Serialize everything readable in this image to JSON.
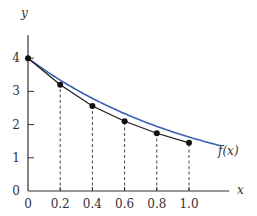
{
  "chart_data": {
    "type": "line",
    "title": "",
    "xlabel": "x",
    "ylabel": "y",
    "xlim": [
      0,
      1.2
    ],
    "ylim": [
      0,
      4.6
    ],
    "x_ticks": [
      "0",
      "0.2",
      "0.4",
      "0.6",
      "0.8",
      "1.0"
    ],
    "y_ticks": [
      "0",
      "1",
      "2",
      "3",
      "4"
    ],
    "grid": false,
    "legend": "none",
    "annotations": [
      {
        "text": "f(x)",
        "x": 1.18,
        "y": 1.55
      }
    ],
    "series": [
      {
        "name": "f(x)",
        "kind": "smooth curve",
        "color": "#3a5fb0",
        "x": [
          0,
          0.1,
          0.2,
          0.3,
          0.4,
          0.5,
          0.6,
          0.7,
          0.8,
          0.9,
          1.0,
          1.1,
          1.2
        ],
        "values": [
          4.0,
          3.62,
          3.27,
          2.96,
          2.68,
          2.43,
          2.2,
          1.99,
          1.8,
          1.63,
          1.47,
          1.33,
          1.2
        ]
      },
      {
        "name": "approximation points",
        "kind": "polyline with markers",
        "color": "#1a1a1a",
        "x": [
          0,
          0.2,
          0.4,
          0.6,
          0.8,
          1.0
        ],
        "values": [
          4.0,
          3.2,
          2.56,
          2.1,
          1.74,
          1.45
        ]
      }
    ],
    "dashed_drops_at_x": [
      0.2,
      0.4,
      0.6,
      0.8,
      1.0
    ]
  }
}
